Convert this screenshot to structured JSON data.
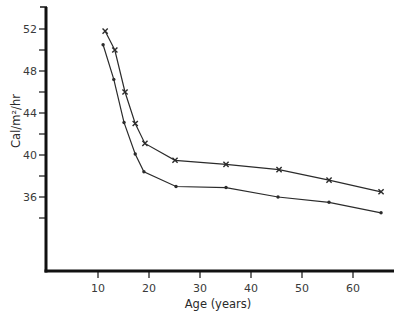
{
  "chart_data": {
    "type": "line",
    "title": "",
    "xlabel": "Age (years)",
    "ylabel": "Cal/m²/hr",
    "xlim": [
      0,
      68
    ],
    "ylim": [
      30,
      54
    ],
    "grid": false,
    "legend": null,
    "x_ticks": [
      10,
      20,
      30,
      40,
      50,
      60
    ],
    "x_tick_labels": [
      "10",
      "20",
      "30",
      "40",
      "50",
      "60"
    ],
    "y_ticks": [
      34,
      36,
      38,
      40,
      42,
      44,
      46,
      48,
      50,
      52
    ],
    "y_tick_labels": [
      "",
      "36",
      "",
      "40",
      "",
      "44",
      "",
      "48",
      "",
      "52"
    ],
    "series": [
      {
        "name": "upper (x markers)",
        "marker": "x",
        "x": [
          11.4,
          13.3,
          15.3,
          17.3,
          19.2,
          25.1,
          35.1,
          45.5,
          55.3,
          65.5
        ],
        "y": [
          51.8,
          50.0,
          46.0,
          43.0,
          41.1,
          39.5,
          39.1,
          38.6,
          37.6,
          36.5
        ]
      },
      {
        "name": "lower (dot markers)",
        "marker": "dot",
        "x": [
          11.0,
          13.1,
          15.1,
          17.3,
          19.0,
          25.3,
          35.1,
          45.3,
          55.3,
          65.5
        ],
        "y": [
          50.5,
          47.2,
          43.1,
          40.1,
          38.4,
          37.0,
          36.9,
          36.0,
          35.5,
          34.5
        ]
      }
    ]
  },
  "layout": {
    "x0_px": 47,
    "px_per_x": 5.1,
    "y52_px": 29,
    "px_per_y": 10.5,
    "axis_x_y_px": 271,
    "axis_y_x_px": 46,
    "axis_x_end_px": 394,
    "axis_y_top_px": 7,
    "line_color": "#2b2b2b",
    "axis_color": "#111111"
  }
}
